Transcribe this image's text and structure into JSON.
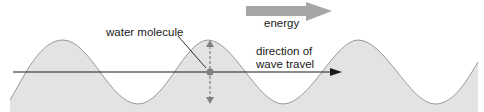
{
  "diagram": {
    "labels": {
      "energy": "energy",
      "water_molecule": "water molecule",
      "direction_line1": "direction of",
      "direction_line2": "wave travel"
    },
    "colors": {
      "wave_fill": "#e3e3e3",
      "wave_stroke": "#9a9a9a",
      "energy_arrow": "#a6a6a6",
      "line": "#1a1a1a",
      "molecule": "#808080",
      "motion_arrow": "#808080"
    }
  }
}
